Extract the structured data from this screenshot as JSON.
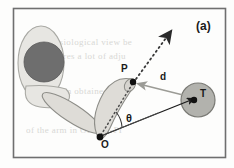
{
  "figure": {
    "panel_label": "(a)",
    "background_color": "#fdfdfc",
    "frame_color": "#6f6f6f",
    "labels": {
      "point_p": "P",
      "point_o": "O",
      "point_t": "T",
      "distance": "d",
      "angle": "θ"
    },
    "watermark": {
      "line1": "the physiological view be",
      "line2": "ples requires a lot of  adju",
      "line3": "at is the an obtained by",
      "line4": "of the  arm  in  OF-U-J-PI"
    },
    "body": {
      "head_outline_color": "#e4e3df",
      "head_fill_color": "#6e6e6e",
      "limb_fill_color": "#dedcd7",
      "limb_stroke_color": "#8d8d88",
      "target_circle_fill": "#b0b0ab",
      "target_circle_stroke": "#7a7a75"
    },
    "geometry": {
      "origin_o": [
        100,
        137
      ],
      "point_p": [
        133,
        82
      ],
      "point_t": [
        194,
        100
      ],
      "target_circle_center": [
        198,
        100
      ],
      "target_circle_radius": 17,
      "head_ellipse_center": [
        41,
        63
      ],
      "head_ellipse_radii": [
        23,
        37
      ],
      "head_circle_center": [
        44,
        62
      ],
      "head_circle_radius": 20,
      "dotted_direction_tip": [
        171,
        33
      ],
      "frame_rect": [
        13,
        8,
        213,
        150
      ]
    }
  }
}
